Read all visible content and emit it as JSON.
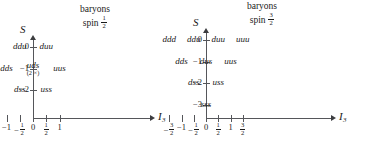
{
  "chart_data": {
    "type": "scatter",
    "panels": [
      {
        "id": "octet",
        "title_line1": "baryons",
        "title_line2_prefix": "spin",
        "spin_num": "1",
        "spin_den": "2",
        "xlabel": "I",
        "xlabel_sub": "3",
        "ylabel": "S",
        "xlim": [
          -1.45,
          1.45
        ],
        "ylim": [
          -2.6,
          0.55
        ],
        "xticks": [
          {
            "value": -1,
            "label": "−1",
            "frac": null
          },
          {
            "value": -0.5,
            "label": null,
            "frac": {
              "sign": "−",
              "num": "1",
              "den": "2"
            }
          },
          {
            "value": 0,
            "label": "0",
            "frac": null
          },
          {
            "value": 0.5,
            "label": null,
            "frac": {
              "sign": "",
              "num": "1",
              "den": "2"
            }
          },
          {
            "value": 1,
            "label": "1",
            "frac": null
          }
        ],
        "yticks": [
          {
            "value": 0,
            "label": "0"
          },
          {
            "value": -1,
            "label": "−1"
          },
          {
            "value": -2,
            "label": "−2"
          }
        ],
        "points": [
          {
            "x": -0.5,
            "y": 0,
            "label": "ddu",
            "multiplicity": null
          },
          {
            "x": 0.5,
            "y": 0,
            "label": "duu",
            "multiplicity": null
          },
          {
            "x": -1,
            "y": -1,
            "label": "dds",
            "multiplicity": null
          },
          {
            "x": 0,
            "y": -1,
            "label": "uds",
            "multiplicity": "(2 ×)"
          },
          {
            "x": 1,
            "y": -1,
            "label": "uus",
            "multiplicity": null
          },
          {
            "x": -0.5,
            "y": -2,
            "label": "dss",
            "multiplicity": null
          },
          {
            "x": 0.5,
            "y": -2,
            "label": "uss",
            "multiplicity": null
          }
        ]
      },
      {
        "id": "decuplet",
        "title_line1": "baryons",
        "title_line2_prefix": "spin",
        "spin_num": "3",
        "spin_den": "2",
        "xlabel": "I",
        "xlabel_sub": "3",
        "ylabel": "S",
        "xlim": [
          -1.85,
          1.85
        ],
        "ylim": [
          -3.6,
          0.55
        ],
        "xticks": [
          {
            "value": -1.5,
            "label": null,
            "frac": {
              "sign": "−",
              "num": "3",
              "den": "2"
            }
          },
          {
            "value": -1,
            "label": "−1",
            "frac": null
          },
          {
            "value": -0.5,
            "label": null,
            "frac": {
              "sign": "−",
              "num": "1",
              "den": "2"
            }
          },
          {
            "value": 0,
            "label": "0",
            "frac": null
          },
          {
            "value": 0.5,
            "label": null,
            "frac": {
              "sign": "",
              "num": "1",
              "den": "2"
            }
          },
          {
            "value": 1,
            "label": "1",
            "frac": null
          },
          {
            "value": 1.5,
            "label": null,
            "frac": {
              "sign": "",
              "num": "3",
              "den": "2"
            }
          }
        ],
        "yticks": [
          {
            "value": 0,
            "label": "0"
          },
          {
            "value": -1,
            "label": "−1"
          },
          {
            "value": -2,
            "label": "−2"
          },
          {
            "value": -3,
            "label": "−3"
          }
        ],
        "points": [
          {
            "x": -1.5,
            "y": 0,
            "label": "ddd",
            "multiplicity": null
          },
          {
            "x": -0.5,
            "y": 0,
            "label": "ddu",
            "multiplicity": null
          },
          {
            "x": 0.5,
            "y": 0,
            "label": "duu",
            "multiplicity": null
          },
          {
            "x": 1.5,
            "y": 0,
            "label": "uuu",
            "multiplicity": null
          },
          {
            "x": -1,
            "y": -1,
            "label": "dds",
            "multiplicity": null
          },
          {
            "x": 0,
            "y": -1,
            "label": "dus",
            "multiplicity": null
          },
          {
            "x": 1,
            "y": -1,
            "label": "uus",
            "multiplicity": null
          },
          {
            "x": -0.5,
            "y": -2,
            "label": "dss",
            "multiplicity": null
          },
          {
            "x": 0.5,
            "y": -2,
            "label": "uss",
            "multiplicity": null
          },
          {
            "x": 0,
            "y": -3,
            "label": "sss",
            "multiplicity": null
          }
        ]
      }
    ],
    "axis_color": "#55565a",
    "text_color": "#1a1a1a",
    "grid": false,
    "legend": null
  }
}
